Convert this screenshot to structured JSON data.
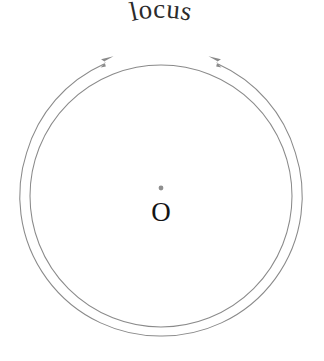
{
  "figure": {
    "canvas": {
      "width": 324,
      "height": 361,
      "background": "#ffffff"
    },
    "colors": {
      "curve_stroke": "#8a8a8a",
      "arrow_fill": "#8a8a8a",
      "center_dot": "#8f8f8f",
      "label_text": "#2b2b2b",
      "point_label_text": "#141414"
    },
    "geometry": {
      "center_x": 161,
      "center_y": 196,
      "inner_radius": 131,
      "outer_radius": 140,
      "stroke_width": 1.05,
      "outer_arc_gap_degrees": 72
    }
  },
  "labels": {
    "locus": "locus",
    "center_point": "O"
  },
  "annotations": {
    "inner_circle_name": "locus-circle",
    "outer_arc_name": "locus-direction-arc",
    "left_arrow_name": "arrow-head-left",
    "right_arrow_name": "arrow-head-right",
    "center_dot_name": "center-point-dot"
  }
}
